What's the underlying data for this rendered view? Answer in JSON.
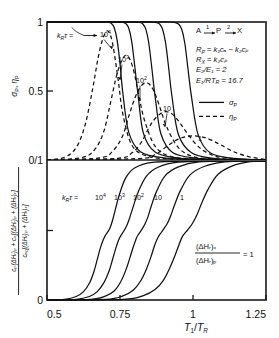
{
  "figure": {
    "panels": [
      "upper",
      "lower"
    ],
    "x_axis": {
      "label": "T1/TR",
      "label_parts": {
        "main1": "T",
        "sub1": "1",
        "slash": "/",
        "main2": "T",
        "sub2": "R"
      },
      "ticks": [
        "0.5",
        "0.75",
        "1",
        "1.25"
      ],
      "tick_values": [
        0.5,
        0.75,
        1.0,
        1.25
      ],
      "range": [
        0.5,
        1.25
      ]
    },
    "upper_panel": {
      "y_label_parts": {
        "s1": "σ",
        "sub1": "P",
        "comma": ", ",
        "s2": "η",
        "sub2": "P"
      },
      "y_ticks": [
        "1",
        "0.5",
        "0/1"
      ],
      "y_tick_values": [
        1.0,
        0.5,
        0.0
      ],
      "y_range": [
        0,
        1
      ],
      "curve_family_label": {
        "k": "k",
        "ksub": "R",
        "tau": "τ",
        "eq": " = "
      },
      "curve_labels": [
        "10⁴",
        "10³",
        "10²",
        "10",
        "1"
      ],
      "curve_label_bases": [
        "10",
        "10",
        "10",
        "10",
        "1"
      ],
      "curve_label_exps": [
        "4",
        "3",
        "2",
        "",
        ""
      ],
      "reaction_scheme": {
        "a": "A",
        "arrow1": "→",
        "n1": "1",
        "p": "P",
        "arrow2": "→",
        "n2": "2",
        "x": "X"
      },
      "equations": [
        {
          "lhs": "R",
          "lhs_sub": "P",
          "rhs": "k₁cₐ − k₂cₚ"
        },
        {
          "lhs": "R",
          "lhs_sub": "X",
          "rhs": "k₂cₚ"
        },
        {
          "lhs": "E₂/E₁",
          "lhs_sub": "",
          "rhs": "2"
        },
        {
          "lhs": "E₁/RT",
          "lhs_sub": "R",
          "rhs": "16.7"
        }
      ],
      "legend": [
        {
          "style": "solid",
          "symbol": "σ",
          "sub": "P"
        },
        {
          "style": "dashed",
          "symbol": "η",
          "sub": "P"
        }
      ]
    },
    "lower_panel": {
      "y_label_fraction": {
        "numerator": "cₚ(ΔHᵣ)ₚ + cₓ[(ΔHᵣ)ₚ + (ΔHᵣ)ₓ]",
        "denominator": "cₐ₀[(ΔHᵣ)ₚ + (ΔHᵣ)ₓ]"
      },
      "y_ticks": [
        "0/1",
        "0"
      ],
      "y_range": [
        0,
        1
      ],
      "curve_family_label": {
        "k": "k",
        "ksub": "R",
        "tau": "τ",
        "eq": " = "
      },
      "curve_labels": [
        "10⁴",
        "10³",
        "10²",
        "10",
        "1"
      ],
      "annotation": {
        "numerator": "(ΔHᵣ)ₓ",
        "denominator": "(ΔHᵣ)ₚ",
        "equals": "= 1"
      }
    }
  },
  "chart_data": {
    "type": "line",
    "title": "",
    "xlabel": "T1/TR",
    "ylabel_upper": "sigma_P, eta_P",
    "ylabel_lower": "cP(dHr)P + cX[(dHr)P+(dHr)X] / cA0[(dHr)P+(dHr)X]",
    "xlim": [
      0.5,
      1.25
    ],
    "ylim_upper": [
      0,
      1
    ],
    "ylim_lower": [
      0,
      1
    ],
    "grid": false,
    "legend_position": "upper-right-inside",
    "panels": [
      {
        "name": "upper",
        "series": [
          {
            "name": "sigma_P kR.tau=1e4",
            "style": "solid",
            "label": "10⁴",
            "x": [
              0.5,
              0.62,
              0.68,
              0.7,
              0.71,
              0.72,
              0.73,
              0.74,
              0.75,
              0.76,
              0.78,
              0.82,
              0.9,
              1.0,
              1.25
            ],
            "y": [
              1.0,
              1.0,
              1.0,
              1.0,
              0.998,
              0.99,
              0.96,
              0.87,
              0.7,
              0.48,
              0.2,
              0.06,
              0.015,
              0.005,
              0.0
            ]
          },
          {
            "name": "sigma_P kR.tau=1e3",
            "style": "solid",
            "label": "10³",
            "x": [
              0.5,
              0.65,
              0.72,
              0.745,
              0.76,
              0.77,
              0.78,
              0.79,
              0.8,
              0.812,
              0.83,
              0.87,
              0.95,
              1.05,
              1.25
            ],
            "y": [
              1.0,
              1.0,
              1.0,
              1.0,
              0.998,
              0.988,
              0.955,
              0.86,
              0.69,
              0.47,
              0.195,
              0.058,
              0.014,
              0.005,
              0.0
            ]
          },
          {
            "name": "sigma_P kR.tau=1e2",
            "style": "solid",
            "label": "10²",
            "x": [
              0.5,
              0.7,
              0.77,
              0.8,
              0.818,
              0.828,
              0.838,
              0.848,
              0.858,
              0.87,
              0.89,
              0.93,
              1.01,
              1.1,
              1.25
            ],
            "y": [
              1.0,
              1.0,
              1.0,
              1.0,
              0.997,
              0.986,
              0.95,
              0.855,
              0.685,
              0.465,
              0.19,
              0.055,
              0.013,
              0.004,
              0.0
            ]
          },
          {
            "name": "sigma_P kR.tau=10",
            "style": "solid",
            "label": "10",
            "x": [
              0.5,
              0.74,
              0.82,
              0.855,
              0.875,
              0.886,
              0.896,
              0.906,
              0.916,
              0.928,
              0.95,
              0.995,
              1.07,
              1.16,
              1.25
            ],
            "y": [
              1.0,
              1.0,
              1.0,
              1.0,
              0.996,
              0.984,
              0.946,
              0.85,
              0.68,
              0.46,
              0.185,
              0.052,
              0.012,
              0.004,
              0.0
            ]
          },
          {
            "name": "sigma_P kR.tau=1",
            "style": "solid",
            "label": "1",
            "x": [
              0.5,
              0.79,
              0.88,
              0.918,
              0.94,
              0.952,
              0.962,
              0.972,
              0.982,
              0.995,
              1.018,
              1.06,
              1.14,
              1.21,
              1.25
            ],
            "y": [
              1.0,
              1.0,
              1.0,
              1.0,
              0.995,
              0.982,
              0.944,
              0.846,
              0.676,
              0.456,
              0.18,
              0.05,
              0.011,
              0.003,
              0.0
            ]
          },
          {
            "name": "eta_P kR.tau=1e4",
            "style": "dashed",
            "label": "10⁴",
            "peak_x": 0.705,
            "peak_y": 0.935,
            "x": [
              0.5,
              0.56,
              0.6,
              0.63,
              0.655,
              0.675,
              0.69,
              0.705,
              0.718,
              0.73,
              0.745,
              0.76,
              0.79,
              0.84,
              0.92,
              1.05,
              1.25
            ],
            "y": [
              0.0,
              0.02,
              0.09,
              0.25,
              0.5,
              0.74,
              0.87,
              0.935,
              0.9,
              0.78,
              0.56,
              0.33,
              0.11,
              0.03,
              0.008,
              0.002,
              0.0
            ]
          },
          {
            "name": "eta_P kR.tau=1e3",
            "style": "dashed",
            "label": "10³",
            "peak_x": 0.77,
            "peak_y": 0.76,
            "x": [
              0.5,
              0.62,
              0.665,
              0.695,
              0.718,
              0.738,
              0.755,
              0.77,
              0.785,
              0.8,
              0.815,
              0.835,
              0.87,
              0.92,
              1.0,
              1.12,
              1.25
            ],
            "y": [
              0.0,
              0.018,
              0.08,
              0.21,
              0.42,
              0.61,
              0.715,
              0.76,
              0.725,
              0.62,
              0.46,
              0.28,
              0.1,
              0.028,
              0.007,
              0.002,
              0.0
            ]
          },
          {
            "name": "eta_P kR.tau=1e2",
            "style": "dashed",
            "label": "10²",
            "peak_x": 0.838,
            "peak_y": 0.56,
            "x": [
              0.5,
              0.68,
              0.725,
              0.758,
              0.782,
              0.802,
              0.82,
              0.838,
              0.855,
              0.872,
              0.89,
              0.912,
              0.95,
              1.0,
              1.08,
              1.18,
              1.25
            ],
            "y": [
              0.0,
              0.015,
              0.065,
              0.17,
              0.33,
              0.455,
              0.53,
              0.56,
              0.54,
              0.47,
              0.36,
              0.23,
              0.09,
              0.025,
              0.006,
              0.002,
              0.0
            ]
          },
          {
            "name": "eta_P kR.tau=10",
            "style": "dashed",
            "label": "10",
            "peak_x": 0.905,
            "peak_y": 0.35,
            "x": [
              0.5,
              0.74,
              0.79,
              0.822,
              0.848,
              0.868,
              0.888,
              0.905,
              0.922,
              0.94,
              0.96,
              0.985,
              1.025,
              1.08,
              1.16,
              1.23,
              1.25
            ],
            "y": [
              0.0,
              0.012,
              0.05,
              0.125,
              0.23,
              0.295,
              0.335,
              0.35,
              0.342,
              0.31,
              0.255,
              0.18,
              0.085,
              0.025,
              0.006,
              0.002,
              0.0
            ]
          },
          {
            "name": "eta_P kR.tau=1",
            "style": "dashed",
            "label": "1",
            "peak_x": 1.0,
            "peak_y": 0.175,
            "x": [
              0.5,
              0.81,
              0.87,
              0.905,
              0.935,
              0.958,
              0.978,
              1.0,
              1.02,
              1.042,
              1.065,
              1.095,
              1.14,
              1.19,
              1.24,
              1.25
            ],
            "y": [
              0.0,
              0.01,
              0.04,
              0.09,
              0.135,
              0.158,
              0.17,
              0.175,
              0.172,
              0.162,
              0.142,
              0.11,
              0.06,
              0.025,
              0.006,
              0.004
            ]
          }
        ]
      },
      {
        "name": "lower",
        "series": [
          {
            "name": "kR.tau=1e4",
            "style": "solid",
            "label": "10⁴",
            "x": [
              0.5,
              0.56,
              0.6,
              0.625,
              0.645,
              0.66,
              0.672,
              0.682,
              0.692,
              0.7,
              0.708,
              0.716,
              0.724,
              0.734,
              0.748,
              0.77,
              0.8,
              0.86,
              1.0,
              1.25
            ],
            "y": [
              0.0,
              0.005,
              0.025,
              0.06,
              0.12,
              0.2,
              0.29,
              0.37,
              0.43,
              0.465,
              0.49,
              0.52,
              0.57,
              0.65,
              0.76,
              0.88,
              0.95,
              0.99,
              1.0,
              1.0
            ]
          },
          {
            "name": "kR.tau=1e3",
            "style": "solid",
            "label": "10³",
            "x": [
              0.5,
              0.6,
              0.645,
              0.672,
              0.695,
              0.712,
              0.725,
              0.736,
              0.746,
              0.755,
              0.764,
              0.773,
              0.783,
              0.795,
              0.812,
              0.84,
              0.88,
              0.95,
              1.1,
              1.25
            ],
            "y": [
              0.0,
              0.005,
              0.025,
              0.06,
              0.125,
              0.205,
              0.295,
              0.375,
              0.435,
              0.47,
              0.5,
              0.535,
              0.59,
              0.67,
              0.775,
              0.89,
              0.955,
              0.992,
              1.0,
              1.0
            ]
          },
          {
            "name": "kR.tau=1e2",
            "style": "solid",
            "label": "10²",
            "x": [
              0.5,
              0.65,
              0.7,
              0.73,
              0.752,
              0.77,
              0.784,
              0.796,
              0.806,
              0.815,
              0.825,
              0.835,
              0.846,
              0.858,
              0.876,
              0.905,
              0.95,
              1.02,
              1.15,
              1.25
            ],
            "y": [
              0.0,
              0.005,
              0.028,
              0.065,
              0.13,
              0.215,
              0.305,
              0.385,
              0.445,
              0.478,
              0.508,
              0.545,
              0.6,
              0.682,
              0.785,
              0.895,
              0.958,
              0.993,
              1.0,
              1.0
            ]
          },
          {
            "name": "kR.tau=10",
            "style": "solid",
            "label": "10",
            "x": [
              0.5,
              0.7,
              0.76,
              0.795,
              0.82,
              0.84,
              0.856,
              0.868,
              0.88,
              0.89,
              0.9,
              0.912,
              0.924,
              0.938,
              0.958,
              0.99,
              1.04,
              1.11,
              1.21,
              1.25
            ],
            "y": [
              0.0,
              0.005,
              0.03,
              0.07,
              0.135,
              0.22,
              0.31,
              0.39,
              0.45,
              0.482,
              0.512,
              0.55,
              0.608,
              0.69,
              0.792,
              0.9,
              0.962,
              0.994,
              1.0,
              1.0
            ]
          },
          {
            "name": "kR.tau=1",
            "style": "solid",
            "label": "1",
            "x": [
              0.5,
              0.76,
              0.83,
              0.87,
              0.898,
              0.92,
              0.938,
              0.952,
              0.964,
              0.976,
              0.988,
              1.0,
              1.014,
              1.03,
              1.052,
              1.086,
              1.135,
              1.195,
              1.24,
              1.25
            ],
            "y": [
              0.0,
              0.005,
              0.032,
              0.075,
              0.14,
              0.228,
              0.318,
              0.398,
              0.458,
              0.49,
              0.52,
              0.558,
              0.615,
              0.698,
              0.798,
              0.905,
              0.965,
              0.995,
              1.0,
              1.0
            ]
          }
        ]
      }
    ]
  }
}
